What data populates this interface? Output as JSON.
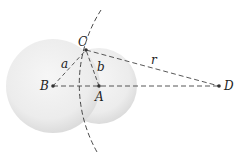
{
  "diagram": {
    "points": [
      {
        "id": "B",
        "label": "B",
        "x": 53,
        "y": 86
      },
      {
        "id": "A",
        "label": "A",
        "x": 99,
        "y": 86
      },
      {
        "id": "C",
        "label": "C",
        "x": 86,
        "y": 50
      },
      {
        "id": "D",
        "label": "D",
        "x": 219,
        "y": 86
      }
    ],
    "segments": [
      {
        "from": "B",
        "to": "C",
        "label": "a"
      },
      {
        "from": "A",
        "to": "C",
        "label": "b"
      },
      {
        "from": "C",
        "to": "D",
        "label": "r"
      },
      {
        "from": "B",
        "to": "D",
        "label": ""
      }
    ],
    "circles": [
      {
        "center": "B",
        "radius": 47
      },
      {
        "center": "A",
        "radius": 38
      }
    ],
    "arc": {
      "center": "D",
      "radius": 138
    },
    "labels": {
      "a": "a",
      "b": "b",
      "r": "r",
      "A": "A",
      "B": "B",
      "C": "C",
      "D": "D"
    }
  }
}
